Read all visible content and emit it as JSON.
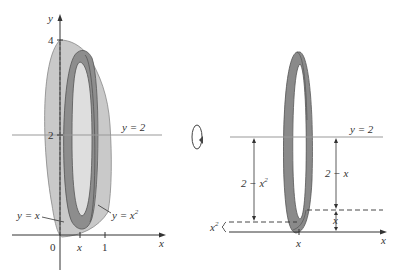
{
  "left_panel": {
    "y_axis_label": "y",
    "x_axis_label": "x",
    "tick_y_4": "4",
    "tick_y_2": "2",
    "tick_x_0": "0",
    "tick_x_x": "x",
    "tick_x_1": "1",
    "line_label": "y = 2",
    "curve_label_line": "y = x",
    "curve_label_parabola": "y = x",
    "parabola_exponent": "2"
  },
  "rotation_icon": "rotation-arrow-icon",
  "right_panel": {
    "line_label": "y = 2",
    "x_axis_label": "x",
    "tick_x_x": "x",
    "outer_dim_label": "2 − x",
    "outer_dim_exponent": "2",
    "inner_dim_label": "2 − x",
    "small_dim_left": "x",
    "small_dim_left_exponent": "2",
    "small_dim_right": "x"
  },
  "colors": {
    "solid_fill": "#c8c8c8",
    "ring_fill": "#8a8a8a",
    "axis": "#333333",
    "line_y2": "#999999"
  }
}
